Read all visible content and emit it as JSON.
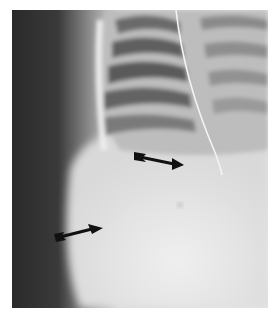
{
  "figure": {
    "kind": "radiograph",
    "background": "#ffffff",
    "arrows": [
      {
        "name": "upper-arrow",
        "from": [
          135,
          156
        ],
        "to": [
          182,
          166
        ],
        "color": "#111111"
      },
      {
        "name": "lower-arrow",
        "from": [
          56,
          238
        ],
        "to": [
          102,
          226
        ],
        "color": "#111111"
      }
    ]
  }
}
